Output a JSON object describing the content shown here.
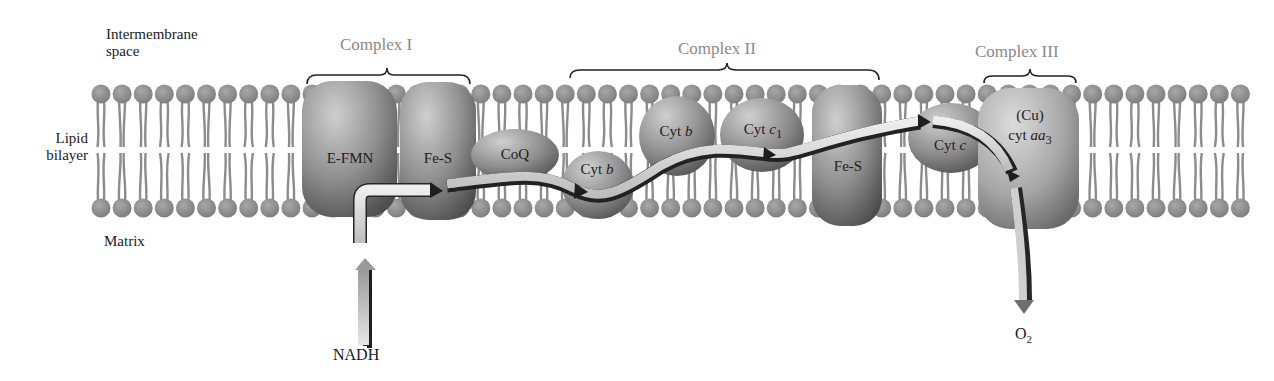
{
  "regions": {
    "intermembrane": "Intermembrane\nspace",
    "intermembrane_line1": "Intermembrane",
    "intermembrane_line2": "space",
    "lipid_line1": "Lipid",
    "lipid_line2": "bilayer",
    "matrix": "Matrix"
  },
  "complexes": [
    {
      "label": "Complex I"
    },
    {
      "label": "Complex II"
    },
    {
      "label": "Complex III"
    }
  ],
  "proteins": {
    "efmn": "E-FMN",
    "fes1": "Fe-S",
    "coq": "CoQ",
    "cytb_low": {
      "prefix": "Cyt ",
      "italic": "b"
    },
    "cytb_high": {
      "prefix": "Cyt ",
      "italic": "b"
    },
    "cytc1": {
      "prefix": "Cyt ",
      "italic": "c",
      "sub": "1"
    },
    "fes2": "Fe-S",
    "cytc": {
      "prefix": "Cyt ",
      "italic": "c"
    },
    "cu": "(Cu)",
    "cytaa3": {
      "prefix": "cyt ",
      "italic": "aa",
      "sub": "3"
    }
  },
  "substrates": {
    "nadh": "NADH",
    "o2": "O",
    "o2_sub": "2"
  },
  "colors": {
    "lipid": "#8c8c8c",
    "protein_dark": "#5a5a5a",
    "protein_light": "#c8c8c8",
    "arrow_fill": "#d9d9d9",
    "complex_label": "#8a8a8a"
  }
}
